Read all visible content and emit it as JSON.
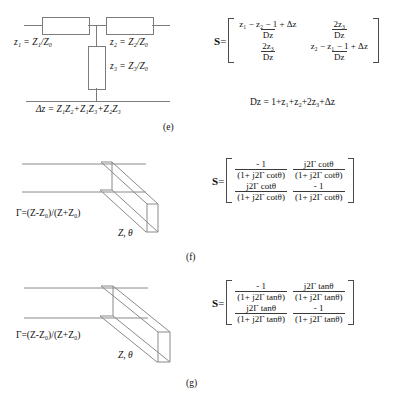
{
  "figure": {
    "line_color": "#7c7c7c"
  },
  "panels": [
    {
      "id": "e",
      "caption": "(e)",
      "circuit": {
        "type": "t-network",
        "labels": {
          "z1": "z₁ = Z₁/Z₀",
          "z2": "z₂ = Z₂/Z₀",
          "z3": "z₃ = Z₃/Z₀",
          "delta": "Δz = Z₁Z₂+Z₁Z₃+Z₂Z₃"
        }
      },
      "matrix": {
        "label": "S",
        "equals": "=",
        "cells": [
          {
            "num": "z₁ − z₂ − 1 + Δz",
            "den": "Dz"
          },
          {
            "num": "2z₃",
            "den": "Dz"
          },
          {
            "num": "2z₃",
            "den": "Dz"
          },
          {
            "num": "z₂ − z₁ − 1 + Δz",
            "den": "Dz"
          }
        ],
        "denominator_note": "Dz = 1+z₁+z₂+2z₃+Δz"
      }
    },
    {
      "id": "f",
      "caption": "(f)",
      "circuit": {
        "type": "shorted-stub",
        "labels": {
          "gamma": "Γ=(Z-Z₀)/(Z+Z₀)",
          "stub": "Z, θ"
        }
      },
      "matrix": {
        "label": "S",
        "equals": "=",
        "cells": [
          {
            "num": "- 1",
            "den": "(1+ j2Γ cotθ)"
          },
          {
            "num": "j2Γ cotθ",
            "den": "(1+ j2Γ cotθ)"
          },
          {
            "num": "j2Γ cotθ",
            "den": "(1+ j2Γ cotθ)"
          },
          {
            "num": "- 1",
            "den": "(1+ j2Γ cotθ)"
          }
        ],
        "denominator_note": ""
      }
    },
    {
      "id": "g",
      "caption": "(g)",
      "circuit": {
        "type": "open-stub",
        "labels": {
          "gamma": "Γ=(Z-Z₀)/(Z+Z₀)",
          "stub": "Z, θ"
        }
      },
      "matrix": {
        "label": "S",
        "equals": "=",
        "cells": [
          {
            "num": "- 1",
            "den": "(1+ j2Γ tanθ)"
          },
          {
            "num": "j2Γ tanθ",
            "den": "(1+ j2Γ tanθ)"
          },
          {
            "num": "j2Γ tanθ",
            "den": "(1+ j2Γ tanθ)"
          },
          {
            "num": "- 1",
            "den": "(1+ j2Γ tanθ)"
          }
        ],
        "denominator_note": ""
      }
    }
  ]
}
